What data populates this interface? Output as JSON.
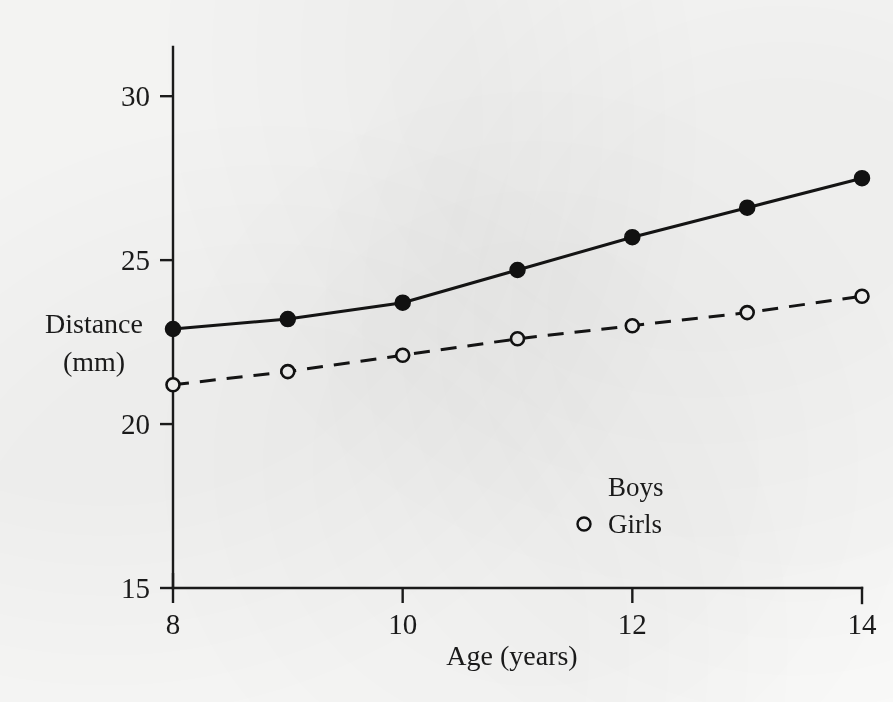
{
  "chart_data": {
    "type": "line",
    "title": "",
    "subtitle": "",
    "xlabel": "Age (years)",
    "ylabel_line1": "Distance",
    "ylabel_line2": "(mm)",
    "x": [
      8,
      9,
      10,
      11,
      12,
      13,
      14
    ],
    "xlim": [
      8,
      14
    ],
    "ylim": [
      15,
      31.5
    ],
    "xticks": [
      8,
      10,
      12,
      14
    ],
    "xticklabels": [
      "8",
      "10",
      "12",
      "14"
    ],
    "yticks": [
      15,
      20,
      25,
      30
    ],
    "yticklabels": [
      "15",
      "20",
      "25",
      "30"
    ],
    "grid": false,
    "legend_position": "inside-lower-right",
    "series": [
      {
        "name": "Boys",
        "marker": "filled-circle",
        "linestyle": "solid",
        "color": "#121212",
        "values": [
          22.9,
          23.2,
          23.7,
          24.7,
          25.7,
          26.6,
          27.5
        ]
      },
      {
        "name": "Girls",
        "marker": "open-circle",
        "linestyle": "dashed",
        "color": "#121212",
        "values": [
          21.2,
          21.6,
          22.1,
          22.6,
          23.0,
          23.4,
          23.9
        ]
      }
    ],
    "legend": [
      {
        "label": "Boys",
        "marker": "none"
      },
      {
        "label": "Girls",
        "marker": "open-circle"
      }
    ]
  },
  "geometry": {
    "plot_left": 173,
    "plot_right": 862,
    "plot_bottom": 588,
    "y_value_top": 31.5,
    "y_pixel_top": 47,
    "y_value_bottom": 15,
    "y_pixel_bottom": 588
  }
}
